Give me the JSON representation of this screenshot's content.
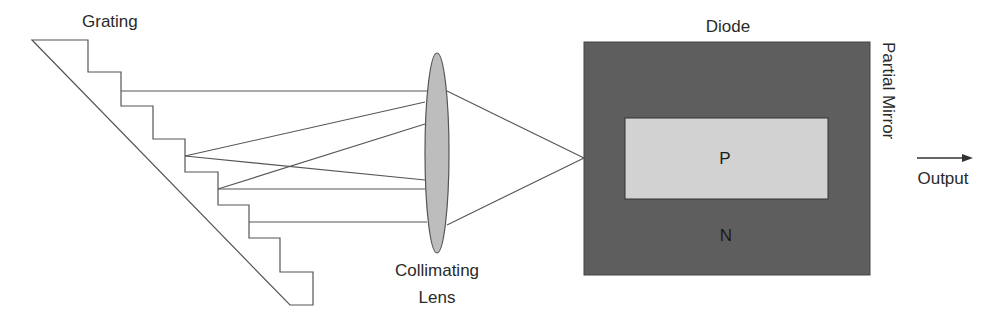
{
  "labels": {
    "grating": "Grating",
    "lens_line1": "Collimating",
    "lens_line2": "Lens",
    "diode": "Diode",
    "p_region": "P",
    "n_region": "N",
    "mirror": "Partial Mirror",
    "output": "Output"
  },
  "colors": {
    "line": "#555555",
    "lens_fill": "#bdbdbd",
    "diode_fill": "#5e5e5e",
    "p_fill": "#d2d2d2",
    "text": "#2a2a2a"
  }
}
